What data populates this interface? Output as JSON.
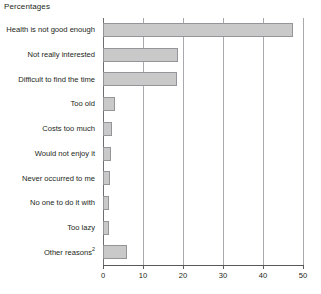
{
  "chart": {
    "title": "Percentages"
  },
  "chart_data": {
    "type": "bar",
    "orientation": "horizontal",
    "title": "Percentages",
    "xlabel": "",
    "ylabel": "",
    "xlim": [
      0,
      50
    ],
    "xticks": [
      0,
      10,
      20,
      30,
      40,
      50
    ],
    "xtick_labels": [
      "0",
      "10",
      "20",
      "30",
      "40",
      "50"
    ],
    "grid": true,
    "legend": null,
    "bar_color": "#c9c9c9",
    "bar_border_color": "#939598",
    "categories": [
      "Health is not good enough",
      "Not really interested",
      "Difficult to find the time",
      "Too old",
      "Costs too much",
      "Would not enjoy it",
      "Never occurred to me",
      "No one to do it with",
      "Too lazy",
      "Other reasons"
    ],
    "category_superscripts": [
      "",
      "",
      "",
      "",
      "",
      "",
      "",
      "",
      "",
      "2"
    ],
    "values": [
      47.5,
      18.7,
      18.4,
      3.0,
      2.2,
      2.1,
      1.8,
      1.5,
      1.4,
      6.0
    ]
  }
}
